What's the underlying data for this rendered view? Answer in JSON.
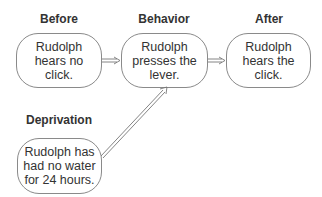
{
  "diagram": {
    "headings": {
      "before": "Before",
      "behavior": "Behavior",
      "after": "After",
      "deprivation": "Deprivation"
    },
    "boxes": {
      "before": "Rudolph\nhears no\nclick.",
      "behavior": "Rudolph\npresses the\nlever.",
      "after": "Rudolph\nhears the\nclick.",
      "deprivation": "Rudolph has\nhad no water\nfor 24 hours."
    },
    "arrows": [
      {
        "from": "before",
        "to": "behavior",
        "style": "double-line"
      },
      {
        "from": "behavior",
        "to": "after",
        "style": "double-line"
      },
      {
        "from": "deprivation",
        "to": "behavior",
        "style": "double-line"
      }
    ],
    "colors": {
      "stroke": "#8a8a8a",
      "text": "#333333",
      "background": "#ffffff"
    }
  }
}
